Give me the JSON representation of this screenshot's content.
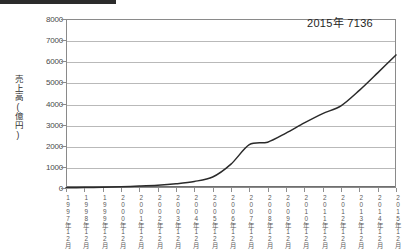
{
  "header": {
    "redaction_bar": ""
  },
  "annotation": {
    "text": "2015年 7136"
  },
  "axes": {
    "ylabel": "売上高(億円)",
    "yticks": [
      "0",
      "1000",
      "2000",
      "3000",
      "4000",
      "5000",
      "6000",
      "7000",
      "8000"
    ],
    "xticks": [
      "1997年12月",
      "1998年12月",
      "1999年12月",
      "2000年12月",
      "2001年12月",
      "2002年12月",
      "2003年12月",
      "2004年12月",
      "2005年12月",
      "2006年12月",
      "2007年12月",
      "2008年12月",
      "2009年12月",
      "2010年12月",
      "2011年12月",
      "2012年12月",
      "2013年12月",
      "2014年12月",
      "2015年12月"
    ]
  },
  "chart_data": {
    "type": "line",
    "title": "",
    "xlabel": "",
    "ylabel": "売上高(億円)",
    "ylim": [
      0,
      8000
    ],
    "grid": true,
    "legend": null,
    "annotations": [
      {
        "text": "2015年 7136",
        "x": "2015年12月",
        "y": 7136
      }
    ],
    "categories": [
      "1997年12月",
      "1998年12月",
      "1999年12月",
      "2000年12月",
      "2001年12月",
      "2002年12月",
      "2003年12月",
      "2004年12月",
      "2005年12月",
      "2006年12月",
      "2007年12月",
      "2008年12月",
      "2009年12月",
      "2010年12月",
      "2011年12月",
      "2012年12月",
      "2013年12月",
      "2014年12月",
      "2015年12月"
    ],
    "series": [
      {
        "name": "売上高",
        "color": "#2a2a2a",
        "values": [
          10,
          20,
          35,
          60,
          90,
          130,
          200,
          310,
          520,
          1130,
          2050,
          2170,
          2600,
          3080,
          3520,
          3890,
          4620,
          5450,
          6300
        ]
      }
    ],
    "values_note": {
      "2006年12月": 2050,
      "2007年12月": 2170,
      "2015年12月": 7136
    }
  },
  "style": {
    "line_color": "#2a2a2a",
    "grid_color": "#b9b9b9",
    "frame_color": "#8a8a8a",
    "background": "#ffffff"
  }
}
